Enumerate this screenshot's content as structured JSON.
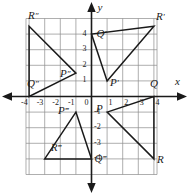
{
  "figure": {
    "type": "coordinate-plane-transformations",
    "axes": {
      "x_label": "x",
      "y_label": "y",
      "x_ticks": [
        "-4",
        "-3",
        "-2",
        "-1",
        "0",
        "1",
        "2",
        "3",
        "4"
      ],
      "y_ticks": [
        "4",
        "3",
        "2",
        "1",
        "-1",
        "-2",
        "-3",
        "-4"
      ],
      "origin_label": "0",
      "x_range": [
        -4.7,
        4.7
      ],
      "y_range": [
        -4.7,
        4.7
      ],
      "grid": true,
      "grid_color": "#8c8c8c",
      "axis_color": "#1a1a1a",
      "shape_color": "#1a1a1a"
    },
    "triangles": [
      {
        "name": "PQR",
        "quadrant": 4,
        "vertices": [
          {
            "label": "P",
            "x": 1,
            "y": -1,
            "label_dx": -11,
            "label_dy": -4
          },
          {
            "label": "Q",
            "x": 4,
            "y": 0,
            "label_dx": -4,
            "label_dy": -14
          },
          {
            "label": "R",
            "x": 4,
            "y": -4,
            "label_dx": 3,
            "label_dy": 0
          }
        ]
      },
      {
        "name": "P'Q'R'",
        "quadrant": 1,
        "vertices": [
          {
            "label": "P′",
            "x": 1,
            "y": 1,
            "label_dx": 3,
            "label_dy": 1
          },
          {
            "label": "Q′",
            "x": 0,
            "y": 4,
            "label_dx": 5,
            "label_dy": -1
          },
          {
            "label": "R′",
            "x": 4,
            "y": 4.5,
            "label_dx": 2,
            "label_dy": -10
          }
        ]
      },
      {
        "name": "P″Q″R″",
        "quadrant": 2,
        "vertices": [
          {
            "label": "P″",
            "x": -1,
            "y": 1.5,
            "label_dx": -16,
            "label_dy": 0
          },
          {
            "label": "Q″",
            "x": -4,
            "y": 0,
            "label_dx": -2,
            "label_dy": -14
          },
          {
            "label": "R″",
            "x": -4,
            "y": 4.5,
            "label_dx": -1,
            "label_dy": -11
          }
        ]
      },
      {
        "name": "P‴Q‴R‴",
        "quadrant": 3,
        "vertices": [
          {
            "label": "P‴",
            "x": -1,
            "y": -1,
            "label_dx": -18,
            "label_dy": -2
          },
          {
            "label": "Q‴",
            "x": 0,
            "y": -4,
            "label_dx": 3,
            "label_dy": -1
          },
          {
            "label": "R‴",
            "x": -3,
            "y": -4,
            "label_dx": 6,
            "label_dy": -12
          }
        ]
      }
    ]
  }
}
